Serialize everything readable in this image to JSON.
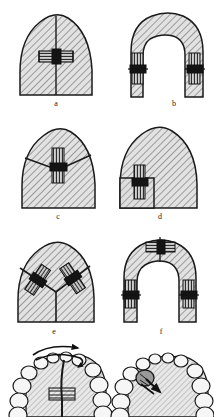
{
  "figure": {
    "background_color": "#ffffff",
    "ink_color": "#1a1a1a",
    "hatch_color": "#555555",
    "fill_color": "#dcdcdc",
    "screw_body_color": "#c8c8c8",
    "screw_dark_color": "#1a1a1a",
    "width_px": 214,
    "height_px": 417
  },
  "panels": [
    {
      "id": "a",
      "caption": "a",
      "shape": "dome",
      "description": "Symmetric palatal dome cross-section split by a vertical midline with a horizontal expansion screw at mid-height",
      "screw_count": 1,
      "screw_orientation": "horizontal",
      "split_line": "vertical-midline"
    },
    {
      "id": "b",
      "caption": "b",
      "shape": "horseshoe",
      "description": "Horseshoe (U-shaped) cross-section with two vertical screws, one in each lateral arm",
      "screw_count": 2,
      "screw_orientation": "vertical",
      "split_line": "two-lateral-horizontal"
    },
    {
      "id": "c",
      "caption": "c",
      "shape": "dome",
      "description": "Dome cross-section with a V-shaped (chevron) section line and a single vertical screw at the apex of the chevron",
      "screw_count": 1,
      "screw_orientation": "vertical",
      "split_line": "chevron"
    },
    {
      "id": "d",
      "caption": "d",
      "shape": "dome",
      "description": "Dome cross-section with a rectangular segment cut from the lower left and a single vertical screw on the segment boundary",
      "screw_count": 1,
      "screw_orientation": "vertical",
      "split_line": "rectangular-segment-left"
    },
    {
      "id": "e",
      "caption": "e",
      "shape": "dome",
      "description": "Dome cross-section divided into three segments by a Y-shaped section line with two oblique screws in the upper oblique cuts",
      "screw_count": 2,
      "screw_orientation": "oblique",
      "split_line": "y-shaped"
    },
    {
      "id": "f",
      "caption": "f",
      "shape": "horseshoe",
      "description": "Horseshoe cross-section with three screws: one horizontal at the crown midline and two vertical in the lateral arms",
      "screw_count": 3,
      "screw_orientation": "mixed",
      "split_line": "midline-and-two-lateral"
    },
    {
      "id": "g",
      "caption": "",
      "shape": "dental-arch-occlusal",
      "description": "Occlusal view of maxillary dental arch with midline split, central expansion screw and paired rotation arrows at the anterior segment",
      "screw_count": 1,
      "arrows": [
        "rotation-arrow-left",
        "rotation-arrow-right"
      ],
      "split_line": "midpalatal-suture"
    },
    {
      "id": "h",
      "caption": "",
      "shape": "dental-arch-occlusal",
      "description": "Occlusal view of maxillary dental arch with a single posterior screw on the left side and a short directional arrow",
      "screw_count": 1,
      "arrows": [
        "direction-arrow"
      ],
      "split_line": "none"
    }
  ]
}
